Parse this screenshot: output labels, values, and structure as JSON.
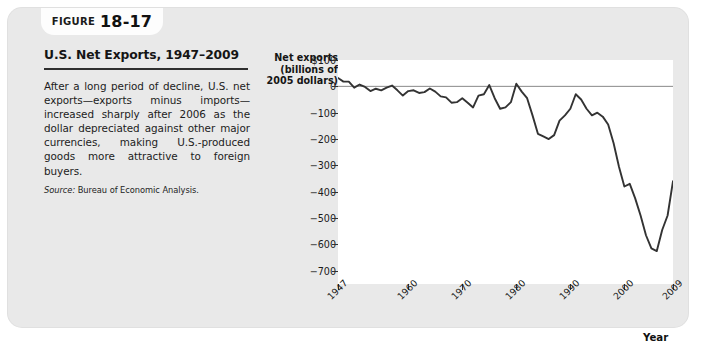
{
  "figure": {
    "tab_word": "Figure",
    "tab_number": "18-17",
    "title": "U.S. Net Exports, 1947–2009",
    "body": "After a long period of decline, U.S. net exports—exports minus imports—increased sharply after 2006 as the dollar depreciated against other major currencies, making U.S.-produced goods more attractive to foreign buyers.",
    "source_label": "Source:",
    "source_text": "Bureau of Economic Analysis."
  },
  "chart_data": {
    "type": "line",
    "title": "U.S. Net Exports, 1947–2009",
    "xlabel": "Year",
    "ylabel": "Net exports (billions of 2005 dollars)",
    "ylabel_lines": [
      "Net exports",
      "(billions of",
      "2005 dollars)"
    ],
    "xlim": [
      1947,
      2009
    ],
    "ylim": [
      -750,
      100
    ],
    "grid": false,
    "legend": null,
    "zero_line": true,
    "line_color": "#333333",
    "plot_background": "#ffffff",
    "ytick_labels": [
      "$100",
      "0",
      "−100",
      "−200",
      "−300",
      "−400",
      "−500",
      "−600",
      "−700"
    ],
    "ytick_values": [
      100,
      0,
      -100,
      -200,
      -300,
      -400,
      -500,
      -600,
      -700
    ],
    "xtick_labels": [
      "1947",
      "1960",
      "1970",
      "1980",
      "1990",
      "2000",
      "2009"
    ],
    "xtick_values": [
      1947,
      1960,
      1970,
      1980,
      1990,
      2000,
      2009
    ],
    "series": [
      {
        "name": "Net exports",
        "x": [
          1947,
          1948,
          1949,
          1950,
          1951,
          1952,
          1953,
          1954,
          1955,
          1956,
          1957,
          1958,
          1959,
          1960,
          1961,
          1962,
          1963,
          1964,
          1965,
          1966,
          1967,
          1968,
          1969,
          1970,
          1971,
          1972,
          1973,
          1974,
          1975,
          1976,
          1977,
          1978,
          1979,
          1980,
          1981,
          1982,
          1983,
          1984,
          1985,
          1986,
          1987,
          1988,
          1989,
          1990,
          1991,
          1992,
          1993,
          1994,
          1995,
          1996,
          1997,
          1998,
          1999,
          2000,
          2001,
          2002,
          2003,
          2004,
          2005,
          2006,
          2007,
          2008,
          2009
        ],
        "values": [
          32,
          18,
          18,
          -5,
          7,
          -2,
          -18,
          -9,
          -15,
          -5,
          3,
          -15,
          -35,
          -18,
          -15,
          -25,
          -22,
          -8,
          -20,
          -38,
          -42,
          -62,
          -60,
          -45,
          -62,
          -80,
          -35,
          -30,
          5,
          -45,
          -85,
          -80,
          -60,
          10,
          -20,
          -45,
          -110,
          -180,
          -190,
          -200,
          -185,
          -130,
          -110,
          -85,
          -30,
          -50,
          -85,
          -110,
          -100,
          -115,
          -145,
          -215,
          -305,
          -380,
          -370,
          -425,
          -490,
          -565,
          -615,
          -625,
          -545,
          -490,
          -360
        ]
      }
    ],
    "annotations": []
  }
}
